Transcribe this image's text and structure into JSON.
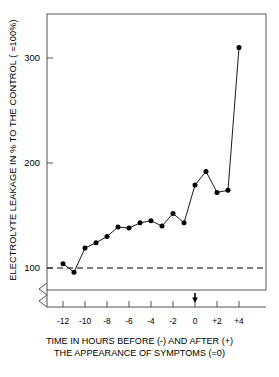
{
  "chart_data": {
    "type": "line",
    "title": "",
    "subtitle": "",
    "xlabel": "TIME IN HOURS BEFORE (-) AND AFTER (+) THE APPEARANCE OF SYMPTOMS (=0)",
    "ylabel": "ELECTROLYTE LEAKAGE IN % TO THE CONTROL ( =100%)",
    "x": [
      -12,
      -11,
      -10,
      -9,
      -8,
      -7,
      -6,
      -5,
      -4,
      -3,
      -2,
      -1,
      0,
      1,
      2,
      3,
      4
    ],
    "values": [
      104,
      96,
      119,
      124,
      130,
      139,
      138,
      143,
      145,
      140,
      152,
      143,
      179,
      192,
      172,
      174,
      310
    ],
    "xlim": [
      -13,
      5
    ],
    "ylim": [
      88,
      330
    ],
    "xticks": [
      -12,
      -10,
      -8,
      -6,
      -4,
      -2,
      0,
      2,
      4
    ],
    "xtick_labels": [
      "-12",
      "-10",
      "-8",
      "-6",
      "-4",
      "-2",
      "0",
      "+2",
      "+4"
    ],
    "yticks": [
      100,
      200,
      300
    ],
    "ytick_labels": [
      "100",
      "200",
      "300"
    ],
    "grid": false,
    "legend": null,
    "marker": "filled-circle",
    "line_color": "#000000",
    "marker_color": "#000000",
    "reference_line": {
      "value": 100,
      "style": "dashed",
      "label": "control = 100%"
    },
    "axis_break": {
      "axis": "y",
      "style": "zigzag",
      "below": 100
    },
    "annotations": [
      {
        "type": "arrow",
        "x": 0,
        "direction": "down",
        "note": "appearance of symptoms"
      }
    ]
  },
  "axis_titles": {
    "y": "ELECTROLYTE LEAKAGE IN % TO THE CONTROL ( =100%)",
    "x_line1": "TIME IN HOURS BEFORE (-) AND AFTER (+)",
    "x_line2": "THE APPEARANCE OF SYMPTOMS (=0)"
  },
  "ytick_labels": [
    "300",
    "200",
    "100"
  ],
  "xtick_labels": [
    "-12",
    "-10",
    "-8",
    "-6",
    "-4",
    "-2",
    "0",
    "+2",
    "+4"
  ],
  "colors": {
    "foreground": "#000000",
    "background": "#ffffff",
    "frame": "#555555"
  }
}
